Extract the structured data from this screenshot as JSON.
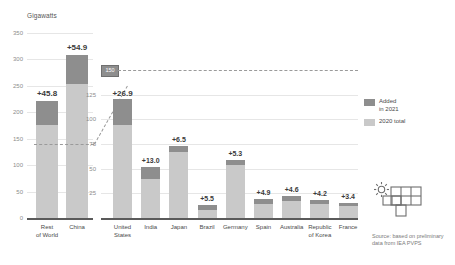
{
  "chart_data": {
    "type": "bar",
    "title": "",
    "subtitle": "",
    "ylabel": "Gigawatts",
    "xlabel": "",
    "grid": true,
    "legend_position": "right",
    "stacked": true,
    "panels": [
      {
        "name": "left-panel",
        "ylim": [
          0,
          350
        ],
        "yticks": [
          "0",
          "50",
          "100",
          "150",
          "200",
          "250",
          "300",
          "350"
        ],
        "ytick_values": [
          0,
          50,
          100,
          150,
          200,
          250,
          300,
          350
        ],
        "categories": [
          "Rest\nof World",
          "China"
        ],
        "category_labels": [
          "Rest of World",
          "China"
        ],
        "series": [
          {
            "name": "2020 total",
            "values": [
              175.0,
              253.0
            ],
            "color": "#c9c9c9"
          },
          {
            "name": "Added in 2021",
            "values": [
              45.8,
              54.9
            ],
            "color": "#8e8e8e"
          }
        ],
        "value_labels": [
          "+45.8",
          "+54.9"
        ]
      },
      {
        "name": "right-panel",
        "ylim": [
          0,
          150
        ],
        "yticks": [
          "25",
          "50",
          "75",
          "100",
          "125",
          "150"
        ],
        "ytick_values": [
          25,
          50,
          75,
          100,
          125,
          150
        ],
        "zoom_marker_label": "150",
        "categories": [
          "United\nStates",
          "India",
          "Japan",
          "Brazil",
          "Germany",
          "Spain",
          "Australia",
          "Republic\nof Korea",
          "France"
        ],
        "category_labels": [
          "United States",
          "India",
          "Japan",
          "Brazil",
          "Germany",
          "Spain",
          "Australia",
          "Republic of Korea",
          "France"
        ],
        "series": [
          {
            "name": "2020 total",
            "values": [
              94.0,
              39.0,
              67.0,
              7.8,
              53.8,
              14.1,
              17.4,
              14.6,
              11.7
            ],
            "color": "#c9c9c9"
          },
          {
            "name": "Added in 2021",
            "values": [
              26.9,
              13.0,
              6.5,
              5.5,
              5.3,
              4.9,
              4.6,
              4.2,
              3.4
            ],
            "color": "#8e8e8e"
          }
        ],
        "value_labels": [
          "+26.9",
          "+13.0",
          "+6.5",
          "+5.5",
          "+5.3",
          "+4.9",
          "+4.6",
          "+4.2",
          "+3.4"
        ]
      }
    ],
    "legend": [
      {
        "label": "Added\nin 2021",
        "color": "#8e8e8e"
      },
      {
        "label": "2020 total",
        "color": "#c9c9c9"
      }
    ],
    "source": "Source: based on preliminary\ndata from IEA PVPS",
    "colors": {
      "added_2021": "#8e8e8e",
      "total_2020": "#c9c9c9",
      "gridline": "#e6e6e6",
      "baseline": "#5a5a5a",
      "text": "#4a4a4a",
      "tick_text": "#8d8d8d",
      "background": "#ffffff"
    },
    "icons": {
      "solar_panel": "solar-panel-icon"
    }
  }
}
